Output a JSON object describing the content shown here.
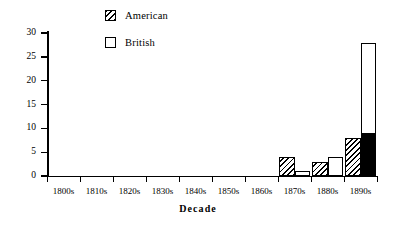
{
  "chart_data": {
    "type": "bar",
    "title": "",
    "xlabel": "Decade",
    "ylabel": "Number of Papers",
    "ylim": [
      0,
      30
    ],
    "yticks": [
      0,
      5,
      10,
      15,
      20,
      25,
      30
    ],
    "grid": false,
    "legend_position": "top-center",
    "categories": [
      "1800s",
      "1810s",
      "1820s",
      "1830s",
      "1840s",
      "1850s",
      "1860s",
      "1870s",
      "1880s",
      "1890s"
    ],
    "series": [
      {
        "name": "American",
        "fill": "hatched",
        "values": [
          0,
          0,
          0,
          0,
          0,
          0,
          0,
          4,
          3,
          8
        ]
      },
      {
        "name": "British",
        "fill": "white",
        "values": [
          0,
          0,
          0,
          0,
          0,
          0,
          0,
          1,
          4,
          28
        ]
      }
    ],
    "annotations": [
      {
        "text": "1890s British bar has a solid black lower segment up to 9",
        "value": 9
      }
    ]
  },
  "legend": {
    "items": [
      {
        "label": "American",
        "swatch": "hatched-square-icon"
      },
      {
        "label": "British",
        "swatch": "white-square-icon"
      }
    ]
  },
  "axes": {
    "y": {
      "title": "Number of Papers",
      "ticks": [
        "0",
        "5",
        "10",
        "15",
        "20",
        "25",
        "30"
      ]
    },
    "x": {
      "title": "Decade",
      "ticks": [
        "1800s",
        "1810s",
        "1820s",
        "1830s",
        "1840s",
        "1850s",
        "1860s",
        "1870s",
        "1880s",
        "1890s"
      ]
    }
  }
}
